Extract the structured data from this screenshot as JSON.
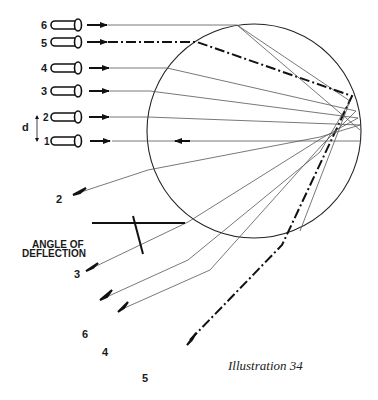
{
  "caption": "Illustration 34",
  "angle_label": {
    "line1": "ANGLE OF",
    "line2": "DEFLECTION"
  },
  "distance_label": "d",
  "guns": [
    {
      "id": "6",
      "label": "6",
      "y": 25
    },
    {
      "id": "5",
      "label": "5",
      "y": 42
    },
    {
      "id": "4",
      "label": "4",
      "y": 68
    },
    {
      "id": "3",
      "label": "3",
      "y": 91
    },
    {
      "id": "2",
      "label": "2",
      "y": 117
    },
    {
      "id": "1",
      "label": "1",
      "y": 141
    }
  ],
  "exit_labels": [
    {
      "id": "2",
      "label": "2"
    },
    {
      "id": "3",
      "label": "3"
    },
    {
      "id": "6",
      "label": "6"
    },
    {
      "id": "4",
      "label": "4"
    },
    {
      "id": "5",
      "label": "5"
    }
  ],
  "colors": {
    "ink": "#1a1a1a",
    "ray": "#555555",
    "background": "#ffffff"
  }
}
